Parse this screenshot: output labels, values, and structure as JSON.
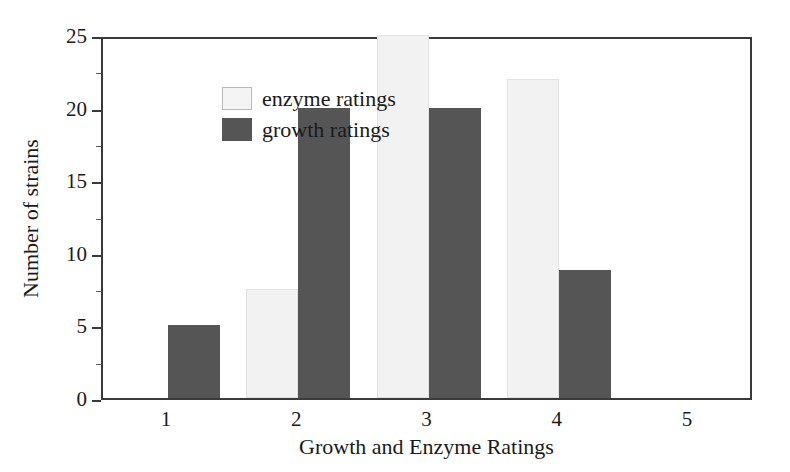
{
  "chart_data": {
    "type": "bar",
    "title": "",
    "subtitle": "",
    "xlabel": "Growth and Enzyme Ratings",
    "ylabel": "Number of strains",
    "categories": [
      "1",
      "2",
      "3",
      "4",
      "5"
    ],
    "series": [
      {
        "name": "enzyme ratings",
        "color": "#f2f2f2",
        "values": [
          0,
          7.5,
          25,
          22,
          0
        ]
      },
      {
        "name": "growth ratings",
        "color": "#555555",
        "values": [
          5,
          20,
          20,
          8.8,
          0
        ]
      }
    ],
    "ylim": [
      0,
      25
    ],
    "xlim": [
      0.5,
      5.5
    ],
    "y_major_ticks": [
      0,
      5,
      10,
      15,
      20,
      25
    ],
    "y_minor_ticks": [
      2.5,
      7.5,
      12.5,
      17.5,
      22.5
    ],
    "y_tick_labels": [
      "0",
      "5",
      "10",
      "15",
      "20",
      "25"
    ],
    "x_tick_labels": [
      "1",
      "2",
      "3",
      "4",
      "5"
    ],
    "grid": false,
    "legend_position": "upper left"
  },
  "legend": {
    "entries": [
      {
        "label": "enzyme ratings",
        "swatch": "light-gray-swatch"
      },
      {
        "label": "growth ratings",
        "swatch": "dark-gray-swatch"
      }
    ]
  },
  "axes": {
    "y_title": "Number of strains",
    "x_title": "Growth and Enzyme Ratings"
  },
  "colors": {
    "enzyme_fill": "#f2f2f2",
    "growth_fill": "#555555",
    "axis_line": "#3a3a3a",
    "text": "#1a1a1a",
    "background": "#ffffff"
  }
}
